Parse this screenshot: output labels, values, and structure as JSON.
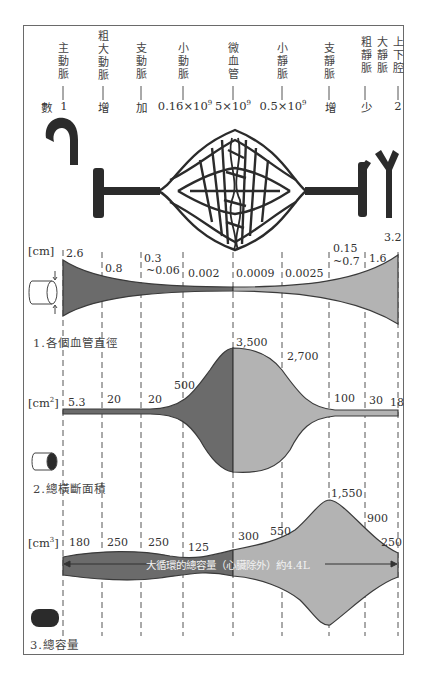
{
  "vessels": [
    {
      "id": "aorta",
      "label": "主動脈",
      "count": "1",
      "x": 63
    },
    {
      "id": "large-arteries",
      "label": "粗大動脈",
      "count": "增",
      "x": 103
    },
    {
      "id": "branch-arteries",
      "label": "支動脈",
      "count": "加",
      "x": 141
    },
    {
      "id": "arterioles",
      "label": "小動脈",
      "count": "0.16×10",
      "count_exp": "9",
      "x": 183
    },
    {
      "id": "capillaries",
      "label": "微血管",
      "count": "5×10",
      "count_exp": "9",
      "x": 233
    },
    {
      "id": "venules",
      "label": "小靜脈",
      "count": "0.5×10",
      "count_exp": "9",
      "x": 282
    },
    {
      "id": "branch-veins",
      "label": "支靜脈",
      "count": "增",
      "x": 329
    },
    {
      "id": "large-veins",
      "label": "粗靜脈",
      "count": "少",
      "x": 365
    },
    {
      "id": "venae-cavae-col",
      "label": "大靜脈",
      "count": "",
      "x": 381
    },
    {
      "id": "vena-cava",
      "label": "上下腔",
      "count": "2",
      "x": 398
    }
  ],
  "count_row_label": "數",
  "panel1": {
    "unit": "[cm]",
    "caption": "1.各個血管直徑",
    "values": [
      "2.6",
      "0.8",
      "0.3",
      "~0.06",
      "0.002",
      "0.0009",
      "0.0025",
      "0.15",
      "~0.7",
      "1.6",
      "3.2"
    ]
  },
  "panel2": {
    "unit": "[cm",
    "unit_exp": "2",
    "caption": "2.總橫斷面積",
    "values": [
      "5.3",
      "20",
      "20",
      "500",
      "3,500",
      "2,700",
      "100",
      "30",
      "18"
    ]
  },
  "panel3": {
    "unit": "[cm",
    "unit_exp": "3",
    "caption": "3.總容量",
    "values": [
      "180",
      "250",
      "250",
      "125",
      "300",
      "550",
      "1,550",
      "900",
      "250"
    ],
    "overlay": "大循環的總容量（心臟除外）約4.4L"
  },
  "colors": {
    "arterial_fill": "#6b6b6b",
    "venous_fill": "#b3b3b3",
    "outline": "#3a3a3a",
    "vessel_dark": "#2b2b2b",
    "dash": "#555555"
  },
  "chart_data": [
    {
      "type": "area",
      "title": "1.各個血管直徑",
      "ylabel": "cm",
      "categories": [
        "主動脈",
        "粗大動脈",
        "支動脈",
        "小動脈",
        "微血管",
        "小靜脈",
        "支靜脈",
        "粗靜脈",
        "大靜脈",
        "上下腔"
      ],
      "values": [
        "2.6",
        "0.8",
        "0.3~0.06",
        "0.002",
        "0.0009",
        "0.0025",
        "0.15~0.7",
        "1.6",
        "",
        "3.2"
      ]
    },
    {
      "type": "area",
      "title": "2.總橫斷面積",
      "ylabel": "cm²",
      "categories": [
        "主動脈",
        "粗大動脈",
        "支動脈",
        "小動脈",
        "微血管",
        "小靜脈",
        "支靜脈",
        "粗靜脈",
        "上下腔"
      ],
      "values": [
        5.3,
        20,
        20,
        500,
        3500,
        2700,
        100,
        30,
        18
      ]
    },
    {
      "type": "area",
      "title": "3.總容量",
      "ylabel": "cm³",
      "categories": [
        "主動脈",
        "粗大動脈",
        "支動脈",
        "小動脈",
        "微血管",
        "小靜脈",
        "支靜脈",
        "粗靜脈",
        "上下腔"
      ],
      "values": [
        180,
        250,
        250,
        125,
        300,
        550,
        1550,
        900,
        250
      ],
      "annotation": "大循環的總容量（心臟除外）約4.4L"
    },
    {
      "type": "table",
      "title": "數",
      "categories": [
        "主動脈",
        "粗大動脈",
        "支動脈",
        "小動脈",
        "微血管",
        "小靜脈",
        "支靜脈",
        "粗靜脈",
        "上下腔"
      ],
      "values": [
        "1",
        "增",
        "加",
        "0.16×10^9",
        "5×10^9",
        "0.5×10^9",
        "增",
        "少",
        "2"
      ]
    }
  ]
}
